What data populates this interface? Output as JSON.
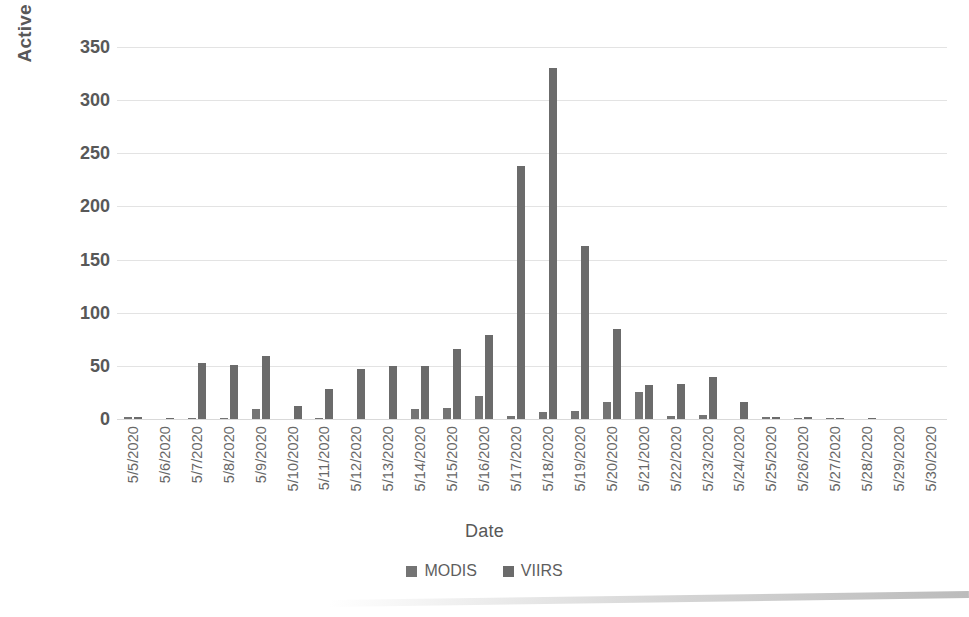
{
  "chart_data": {
    "type": "bar",
    "title": "",
    "xlabel": "Date",
    "ylabel": "Active fires",
    "ylim": [
      0,
      350
    ],
    "yticks": [
      0,
      50,
      100,
      150,
      200,
      250,
      300,
      350
    ],
    "grid": true,
    "legend_position": "bottom",
    "categories": [
      "5/5/2020",
      "5/6/2020",
      "5/7/2020",
      "5/8/2020",
      "5/9/2020",
      "5/10/2020",
      "5/11/2020",
      "5/12/2020",
      "5/13/2020",
      "5/14/2020",
      "5/15/2020",
      "5/16/2020",
      "5/17/2020",
      "5/18/2020",
      "5/19/2020",
      "5/20/2020",
      "5/21/2020",
      "5/22/2020",
      "5/23/2020",
      "5/24/2020",
      "5/25/2020",
      "5/26/2020",
      "5/27/2020",
      "5/28/2020",
      "5/29/2020",
      "5/30/2020"
    ],
    "series": [
      {
        "name": "MODIS",
        "color": "#747474",
        "values": [
          2,
          0,
          1,
          1,
          9,
          0,
          1,
          0,
          0,
          9,
          10,
          22,
          3,
          7,
          8,
          16,
          25,
          3,
          4,
          0,
          2,
          1,
          1,
          0,
          0,
          0
        ]
      },
      {
        "name": "VIIRS",
        "color": "#6b6b6b",
        "values": [
          2,
          1,
          53,
          51,
          59,
          12,
          28,
          47,
          50,
          50,
          66,
          79,
          238,
          330,
          163,
          85,
          32,
          33,
          40,
          16,
          2,
          2,
          1,
          1,
          0,
          0
        ]
      }
    ]
  },
  "legend": {
    "items": [
      {
        "label": "MODIS",
        "color": "#747474"
      },
      {
        "label": "VIIRS",
        "color": "#6b6b6b"
      }
    ]
  }
}
